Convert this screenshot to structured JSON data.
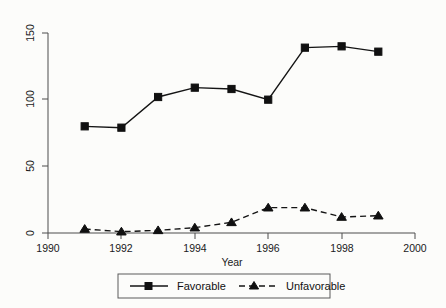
{
  "chart_data": {
    "type": "line",
    "title": "",
    "subtitle": "",
    "xlabel": "Year",
    "ylabel": "",
    "xlim": [
      1990,
      2000
    ],
    "ylim": [
      0,
      150
    ],
    "grid": false,
    "legend_position": "bottom-center",
    "x": [
      1991,
      1992,
      1993,
      1994,
      1995,
      1996,
      1997,
      1998,
      1999
    ],
    "xticks": [
      "1990",
      "1992",
      "1994",
      "1996",
      "1998",
      "2000"
    ],
    "xtick_values": [
      1990,
      1992,
      1994,
      1996,
      1998,
      2000
    ],
    "yticks": [
      "0",
      "50",
      "100",
      "150"
    ],
    "ytick_values": [
      0,
      50,
      100,
      150
    ],
    "series": [
      {
        "name": "Favorable",
        "marker": "square",
        "linestyle": "solid",
        "color": "#101010",
        "values": [
          80,
          79,
          102,
          109,
          108,
          100,
          139,
          140,
          136
        ]
      },
      {
        "name": "Unfavorable",
        "marker": "triangle",
        "linestyle": "dashed",
        "color": "#101010",
        "values": [
          3,
          1,
          2,
          4,
          8,
          19,
          19,
          12,
          13
        ]
      }
    ]
  },
  "axes": {
    "x_axis_title": "Year",
    "y_axis_title": ""
  },
  "legend": {
    "entries": [
      {
        "label": "Favorable",
        "marker": "square",
        "linestyle": "solid"
      },
      {
        "label": "Unfavorable",
        "marker": "triangle",
        "linestyle": "dashed"
      }
    ]
  },
  "colors": {
    "background": "#fcfcfa",
    "ink": "#101010",
    "axis": "#4d4d4d",
    "legend_border": "#5a5a5a"
  }
}
